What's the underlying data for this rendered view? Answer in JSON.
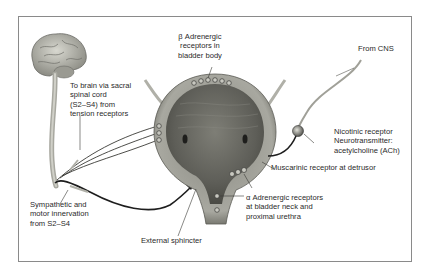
{
  "diagram": {
    "type": "anatomical",
    "labels": {
      "beta_receptors": "β Adrenergic\nreceptors in\nbladder body",
      "to_brain": "To brain via sacral\nspinal cord\n(S2–S4) from\ntension receptors",
      "from_cns": "From CNS",
      "nicotinic": "Nicotinic receptor\nNeurotransmitter:\nacetylcholine (ACh)",
      "muscarinic": "Muscarinic receptor at detrusor",
      "alpha_receptors": "α Adrenergic receptors\nat bladder neck and\nproximal urethra",
      "sympathetic": "Sympathetic and\nmotor innervation\nfrom S2–S4",
      "external_sphincter": "External sphincter"
    },
    "structures": [
      "brain",
      "spinal-cord",
      "bladder",
      "urethra",
      "nerve-ganglion",
      "pelvic-nerves"
    ],
    "colors": {
      "frame": "#8a8a8a",
      "bladder_wall": "#9c9c94",
      "bladder_inner": "#6e6e66",
      "nerve": "#1e1e1e",
      "brain": "#b8b8b0",
      "label_text": "#2a2a2a"
    }
  }
}
